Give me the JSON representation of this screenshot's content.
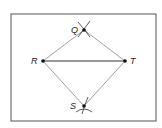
{
  "frame": {
    "x": 11,
    "y": 14,
    "width": 145,
    "height": 107,
    "stroke": "#555555"
  },
  "points": [
    {
      "id": "Q",
      "label": "Q",
      "x": 84,
      "y": 30,
      "lx": 71,
      "ly": 33
    },
    {
      "id": "R",
      "label": "R",
      "x": 43,
      "y": 61,
      "lx": 31,
      "ly": 64
    },
    {
      "id": "T",
      "label": "T",
      "x": 125,
      "y": 61,
      "lx": 130,
      "ly": 64
    },
    {
      "id": "S",
      "label": "S",
      "x": 84,
      "y": 106,
      "lx": 70,
      "ly": 109
    }
  ],
  "segments": [
    {
      "from": "R",
      "to": "T",
      "color": "#333333",
      "width": 1.2
    },
    {
      "from": "R",
      "to": "Q",
      "color": "#888888",
      "width": 0.8
    },
    {
      "from": "Q",
      "to": "T",
      "color": "#888888",
      "width": 0.8
    },
    {
      "from": "R",
      "to": "S",
      "color": "#888888",
      "width": 0.8
    },
    {
      "from": "S",
      "to": "T",
      "color": "#888888",
      "width": 0.8
    }
  ],
  "arc_marks": [
    {
      "at": "Q",
      "desc": "intersecting compass arcs"
    },
    {
      "at": "S",
      "desc": "intersecting compass arcs"
    }
  ]
}
